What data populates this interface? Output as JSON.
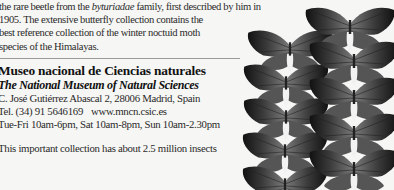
{
  "intro": {
    "line1_pre": "the rare beetle from the ",
    "line1_italic": "byturiadae",
    "line1_post": " family, first described by him in",
    "line2": "1905. The extensive butterfly collection contains the",
    "line3": "best reference collection of the winter noctuid moth",
    "line4": "species of the Himalayas."
  },
  "museum": {
    "name": "Museo nacional de Ciencias naturales",
    "english_name": "The National Museum of Natural Sciences",
    "address": "C. José Gutiérrez Abascal 2, 28006 Madrid, Spain",
    "phone": "Tel. (34) 91 5646169",
    "website": "www.mncn.csic.es",
    "hours": "Tue-Fri 10am-6pm, Sat 10am-8pm, Sun 10am-2.30pm"
  },
  "note": "This important collection has about 2.5 million insects",
  "image": {
    "subject": "butterfly-specimens-photo",
    "colors": {
      "dark_wing": "#1a1a1a",
      "mid_wing": "#6e6e6e",
      "body_white": "#f2f2f2"
    }
  }
}
